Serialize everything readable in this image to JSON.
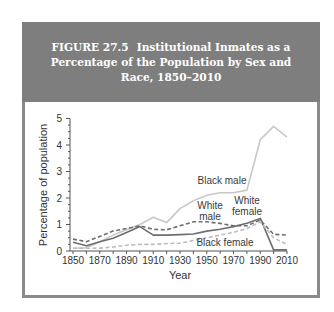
{
  "header": {
    "figure_number": "FIGURE 27.5",
    "title": "Institutional Inmates as a Percentage of the Population by Sex and Race, 1850–2010"
  },
  "chart_data": {
    "type": "line",
    "xlabel": "Year",
    "ylabel": "Percentage of population",
    "xlim": [
      1850,
      2010
    ],
    "ylim": [
      0,
      5
    ],
    "x_ticks": [
      1850,
      1870,
      1890,
      1910,
      1930,
      1950,
      1970,
      1990,
      2010
    ],
    "y_ticks": [
      0,
      1,
      2,
      3,
      4,
      5
    ],
    "grid": false,
    "legend": "inline labels",
    "series": [
      {
        "name": "Black male",
        "style": "solid-light",
        "color": "#c8c8c8",
        "points": [
          [
            1850,
            0.1
          ],
          [
            1860,
            0.12
          ],
          [
            1870,
            0.35
          ],
          [
            1880,
            0.6
          ],
          [
            1890,
            0.8
          ],
          [
            1900,
            1.0
          ],
          [
            1910,
            1.27
          ],
          [
            1920,
            1.07
          ],
          [
            1930,
            1.6
          ],
          [
            1940,
            1.9
          ],
          [
            1950,
            2.1
          ],
          [
            1960,
            2.2
          ],
          [
            1970,
            2.2
          ],
          [
            1980,
            2.3
          ],
          [
            1990,
            4.2
          ],
          [
            2000,
            4.7
          ],
          [
            2010,
            4.3
          ]
        ]
      },
      {
        "name": "White male",
        "style": "dashed-dark",
        "color": "#6e6e6e",
        "points": [
          [
            1850,
            0.45
          ],
          [
            1860,
            0.35
          ],
          [
            1870,
            0.55
          ],
          [
            1880,
            0.75
          ],
          [
            1890,
            0.85
          ],
          [
            1900,
            0.95
          ],
          [
            1910,
            0.82
          ],
          [
            1920,
            0.8
          ],
          [
            1930,
            0.95
          ],
          [
            1940,
            1.1
          ],
          [
            1950,
            1.1
          ],
          [
            1960,
            1.04
          ],
          [
            1970,
            0.95
          ],
          [
            1980,
            0.95
          ],
          [
            1990,
            1.17
          ],
          [
            2000,
            0.63
          ],
          [
            2010,
            0.6
          ]
        ]
      },
      {
        "name": "White female",
        "style": "solid-dark",
        "color": "#6e6e6e",
        "points": [
          [
            1850,
            0.33
          ],
          [
            1860,
            0.2
          ],
          [
            1870,
            0.35
          ],
          [
            1880,
            0.48
          ],
          [
            1890,
            0.7
          ],
          [
            1900,
            0.92
          ],
          [
            1910,
            0.6
          ],
          [
            1920,
            0.6
          ],
          [
            1930,
            0.62
          ],
          [
            1940,
            0.64
          ],
          [
            1950,
            0.75
          ],
          [
            1960,
            0.82
          ],
          [
            1970,
            0.92
          ],
          [
            1980,
            1.05
          ],
          [
            1990,
            1.23
          ],
          [
            2000,
            0.04
          ],
          [
            2010,
            0.04
          ]
        ]
      },
      {
        "name": "Black female",
        "style": "dashed-light",
        "color": "#bdbdbd",
        "points": [
          [
            1850,
            0.1
          ],
          [
            1860,
            0.1
          ],
          [
            1870,
            0.11
          ],
          [
            1880,
            0.15
          ],
          [
            1890,
            0.22
          ],
          [
            1900,
            0.25
          ],
          [
            1910,
            0.25
          ],
          [
            1920,
            0.28
          ],
          [
            1930,
            0.3
          ],
          [
            1940,
            0.4
          ],
          [
            1950,
            0.5
          ],
          [
            1960,
            0.6
          ],
          [
            1970,
            0.7
          ],
          [
            1980,
            0.85
          ],
          [
            1990,
            1.1
          ],
          [
            2000,
            0.5
          ],
          [
            2010,
            0.25
          ]
        ]
      }
    ],
    "annotations": [
      {
        "text": "Black male",
        "x": 1963,
        "y": 2.5
      },
      {
        "text": "White male",
        "x": 1958,
        "y": 1.55
      },
      {
        "text": "White female",
        "x": 1985,
        "y": 1.6
      },
      {
        "text": "Black female",
        "x": 1967,
        "y": 0.35
      }
    ]
  },
  "labels": {
    "y_axis": "Percentage of population",
    "x_axis": "Year",
    "black_male": "Black male",
    "white_male_1": "White",
    "white_male_2": "male",
    "white_female_1": "White",
    "white_female_2": "female",
    "black_female": "Black female"
  }
}
